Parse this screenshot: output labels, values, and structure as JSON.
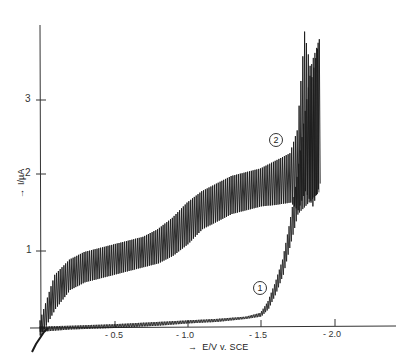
{
  "chart_data": {
    "type": "line",
    "title": "",
    "xlabel": "E/V v. SCE",
    "ylabel": "I/µA",
    "x_ticks": [
      "-0.5",
      "-1.0",
      "-1.5",
      "-2.0"
    ],
    "x_tick_values": [
      -0.5,
      -1.0,
      -1.5,
      -2.0
    ],
    "y_ticks": [
      "1",
      "2",
      "3"
    ],
    "y_tick_values": [
      1,
      2,
      3
    ],
    "xlim": [
      0,
      -2.35
    ],
    "ylim": [
      -0.4,
      4.0
    ],
    "grid": false,
    "legend": "inline circled curve labels",
    "style": "oscillating polarogram (dropping-electrode current oscillations)",
    "series": [
      {
        "name": "1",
        "x": [
          0.0,
          -0.2,
          -0.5,
          -0.8,
          -1.0,
          -1.2,
          -1.4,
          -1.5,
          -1.55,
          -1.6,
          -1.65,
          -1.7,
          -1.75,
          -1.8,
          -1.85,
          -1.9
        ],
        "upper": [
          0.02,
          0.03,
          0.05,
          0.08,
          0.1,
          0.12,
          0.15,
          0.2,
          0.35,
          0.6,
          0.9,
          1.4,
          2.0,
          2.8,
          3.5,
          3.8
        ],
        "lower": [
          -0.05,
          -0.02,
          0.0,
          0.03,
          0.06,
          0.08,
          0.12,
          0.15,
          0.25,
          0.45,
          0.7,
          1.1,
          1.5,
          1.6,
          1.7,
          1.8
        ]
      },
      {
        "name": "2",
        "x": [
          0.0,
          -0.1,
          -0.2,
          -0.3,
          -0.5,
          -0.7,
          -0.8,
          -0.9,
          -1.0,
          -1.1,
          -1.2,
          -1.3,
          -1.4,
          -1.5,
          -1.6,
          -1.7,
          -1.75,
          -1.8,
          -1.85,
          -1.9
        ],
        "upper": [
          0.1,
          0.7,
          0.9,
          1.0,
          1.1,
          1.2,
          1.3,
          1.45,
          1.65,
          1.8,
          1.9,
          2.0,
          2.05,
          2.1,
          2.2,
          2.3,
          2.6,
          3.9,
          3.3,
          3.8
        ],
        "lower": [
          -0.1,
          0.25,
          0.5,
          0.6,
          0.7,
          0.8,
          0.85,
          0.95,
          1.1,
          1.3,
          1.4,
          1.5,
          1.55,
          1.6,
          1.62,
          1.65,
          1.55,
          1.8,
          1.6,
          1.9
        ]
      }
    ],
    "annotations": [
      {
        "text": "2",
        "shape": "circle",
        "x": -1.6,
        "y": 2.45
      },
      {
        "text": "1",
        "shape": "circle",
        "x": -1.55,
        "y": 0.5
      }
    ]
  },
  "labels": {
    "x_axis": "E/V v. SCE",
    "y_axis": "I/µA",
    "x_arrow": "→",
    "y_arrow": "→",
    "curve1": "1",
    "curve2": "2",
    "xt1": "- 0.5",
    "xt2": "- 1.0",
    "xt3": "- 1.5",
    "xt4": "- 2.0",
    "yt1": "1",
    "yt2": "2",
    "yt3": "3"
  }
}
